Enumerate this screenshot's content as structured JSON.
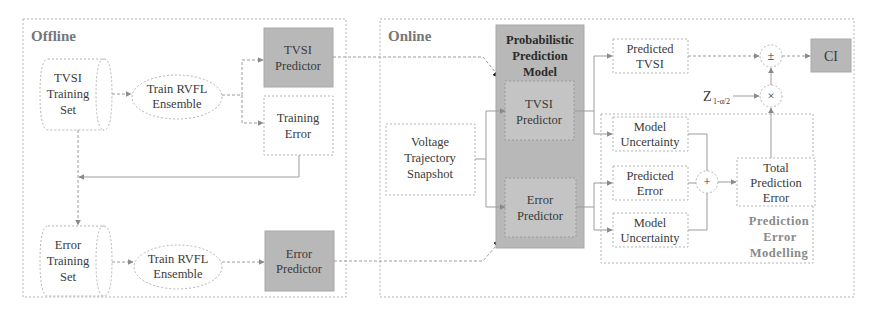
{
  "offline": {
    "title": "Offline",
    "tvsi_training_set": [
      "TVSI",
      "Training",
      "Set"
    ],
    "train_rvfl_1": [
      "Train RVFL",
      "Ensemble"
    ],
    "tvsi_predictor": [
      "TVSI",
      "Predictor"
    ],
    "training_error": [
      "Training",
      "Error"
    ],
    "error_training_set": [
      "Error",
      "Training",
      "Set"
    ],
    "train_rvfl_2": [
      "Train RVFL",
      "Ensemble"
    ],
    "error_predictor": [
      "Error",
      "Predictor"
    ]
  },
  "online": {
    "title": "Online",
    "probabilistic_model": [
      "Probabilistic",
      "Prediction",
      "Model"
    ],
    "tvsi_predictor": [
      "TVSI",
      "Predictor"
    ],
    "error_predictor": [
      "Error",
      "Predictor"
    ],
    "voltage_snapshot": [
      "Voltage",
      "Trajectory",
      "Snapshot"
    ],
    "predicted_tvsi": [
      "Predicted",
      "TVSI"
    ],
    "model_uncertainty_1": [
      "Model",
      "Uncertainty"
    ],
    "predicted_error": [
      "Predicted",
      "Error"
    ],
    "model_uncertainty_2": [
      "Model",
      "Uncertainty"
    ],
    "total_prediction_error": [
      "Total",
      "Prediction",
      "Error"
    ],
    "pem_label": [
      "Prediction",
      "Error",
      "Modelling"
    ],
    "plus_minus_op": "±",
    "times_op": "×",
    "sum_op": "+",
    "z_label": "Z",
    "z_subscript": "1-α/2",
    "ci": "CI"
  },
  "colors": {
    "shaded_block": "#b8b8b8",
    "border": "#b5b5b5",
    "connector": "#9c9c9c"
  }
}
